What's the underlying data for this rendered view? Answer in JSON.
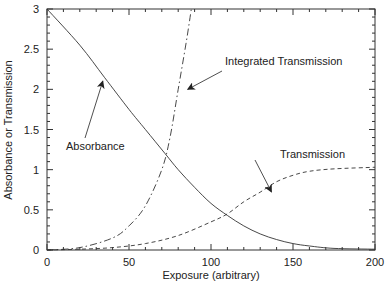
{
  "chart_data": {
    "type": "line",
    "title": "",
    "xlabel": "Exposure (arbitrary)",
    "ylabel": "Absorbance or Transmission",
    "xlim": [
      0,
      200
    ],
    "ylim": [
      0,
      3
    ],
    "xticks": [
      0,
      50,
      100,
      150,
      200
    ],
    "yticks": [
      0,
      0.5,
      1,
      1.5,
      2,
      2.5,
      3
    ],
    "xtick_labels": [
      "0",
      "50",
      "100",
      "150",
      "200"
    ],
    "ytick_labels": [
      "0",
      "0.5",
      "1",
      "1.5",
      "2",
      "2.5",
      "3"
    ],
    "grid": false,
    "legend": "none (curves labeled by annotations with arrows)",
    "series": [
      {
        "name": "Absorbance",
        "style": "solid",
        "x": [
          0,
          20,
          35,
          50,
          60,
          72,
          80,
          90,
          100,
          110,
          120,
          130,
          140,
          150,
          160,
          175,
          200
        ],
        "y": [
          3.0,
          2.55,
          2.15,
          1.75,
          1.5,
          1.2,
          1.0,
          0.78,
          0.58,
          0.43,
          0.3,
          0.2,
          0.13,
          0.08,
          0.05,
          0.02,
          0.01
        ]
      },
      {
        "name": "Integrated Transmission",
        "style": "dash-dot",
        "x": [
          0,
          20,
          40,
          50,
          60,
          70,
          75,
          80,
          85,
          88
        ],
        "y": [
          0,
          0.03,
          0.15,
          0.3,
          0.55,
          1.0,
          1.4,
          2.0,
          2.6,
          3.0
        ]
      },
      {
        "name": "Transmission",
        "style": "dashed",
        "x": [
          0,
          20,
          40,
          60,
          80,
          100,
          110,
          120,
          130,
          140,
          150,
          160,
          175,
          200
        ],
        "y": [
          0,
          0.01,
          0.03,
          0.08,
          0.18,
          0.35,
          0.45,
          0.6,
          0.72,
          0.85,
          0.93,
          0.98,
          1.01,
          1.03
        ]
      }
    ],
    "annotations": [
      {
        "text": "Absorbance",
        "arrow_to": [
          34,
          2.1
        ]
      },
      {
        "text": "Integrated Transmission",
        "arrow_to": [
          84,
          2.0
        ]
      },
      {
        "text": "Transmission",
        "arrow_to": [
          135,
          0.75
        ]
      }
    ]
  }
}
